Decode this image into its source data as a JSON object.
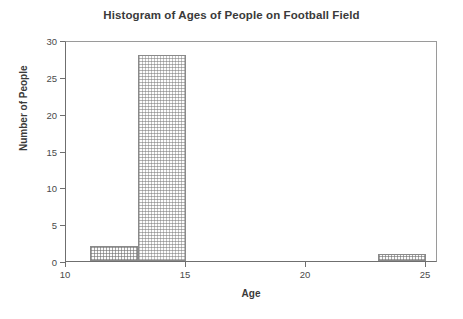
{
  "chart_data": {
    "type": "bar",
    "title": "Histogram of Ages of People on Football Field",
    "xlabel": "Age",
    "ylabel": "Number of People",
    "xlim": [
      10,
      25.5
    ],
    "ylim": [
      0,
      30
    ],
    "xticks": [
      10,
      15,
      20,
      25
    ],
    "yticks": [
      0,
      5,
      10,
      15,
      20,
      25,
      30
    ],
    "xtick_labels": [
      "10",
      "15",
      "20",
      "25"
    ],
    "ytick_labels": [
      "0",
      "5",
      "10",
      "15",
      "20",
      "25",
      "30"
    ],
    "grid": false,
    "legend": false,
    "bin_width": 2,
    "bins": [
      {
        "label": "11-13",
        "start": 11,
        "end": 13,
        "value": 2,
        "fill": "grid"
      },
      {
        "label": "13-15",
        "start": 13,
        "end": 15,
        "value": 28,
        "fill": "dots"
      },
      {
        "label": "23-25",
        "start": 23,
        "end": 25,
        "value": 1,
        "fill": "grid"
      }
    ],
    "categories": [
      "11-13",
      "13-15",
      "23-25"
    ],
    "values": [
      2,
      28,
      1
    ],
    "colors": {
      "bar_border": "#8a8a8a",
      "bar_fill": "#fcfcfc",
      "axis": "#6f6f6f",
      "frame": "#9a9a9a",
      "text": "#3a3a3a",
      "background": "#ffffff"
    }
  }
}
